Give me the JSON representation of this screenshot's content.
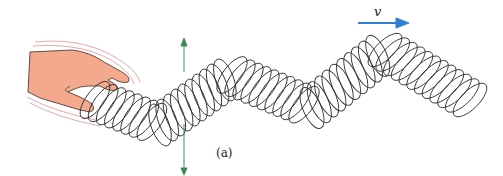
{
  "figure": {
    "caption": "(a)",
    "velocity_label": "v",
    "elements": {
      "hand": "hand shaking spring end up and down",
      "spring": "slinky spring forming transverse wave",
      "displacement_arrow": "vertical double-headed arrow",
      "velocity_arrow": "wave propagation direction to the right"
    },
    "colors": {
      "hand_fill": "#f4a98c",
      "hand_outline": "#3a2a25",
      "motion_lines": "#e8a8a8",
      "spring": "#333333",
      "displacement_arrow": "#3c8a5a",
      "velocity_arrow": "#2f7fd6"
    }
  }
}
